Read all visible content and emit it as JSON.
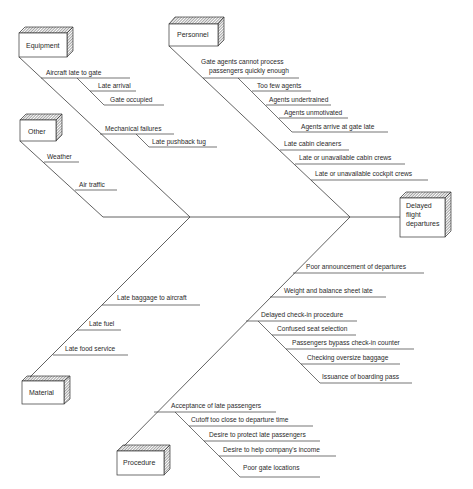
{
  "effect": {
    "lines": [
      "Delayed",
      "flight",
      "departures"
    ]
  },
  "categories": {
    "equipment": {
      "label": "Equipment",
      "causes": [
        {
          "label": "Aircraft late to gate",
          "subcauses": [
            "Late arrival",
            "Gate occupied"
          ]
        },
        {
          "label": "Mechanical failures",
          "subcauses": [
            "Late pushback tug"
          ]
        }
      ]
    },
    "other": {
      "label": "Other",
      "causes": [
        {
          "label": "Weather"
        },
        {
          "label": "Air traffic"
        }
      ]
    },
    "personnel": {
      "label": "Personnel",
      "causes": [
        {
          "label_lines": [
            "Gate agents cannot process",
            "passengers quickly enough"
          ],
          "subcauses": [
            "Too few agents",
            "Agents undertrained",
            "Agents unmotivated",
            "Agents arrive at gate late"
          ]
        },
        {
          "label": "Late cabin cleaners"
        },
        {
          "label": "Late or unavailable cabin crews"
        },
        {
          "label": "Late or unavailable cockpit crews"
        }
      ]
    },
    "material": {
      "label": "Material",
      "causes": [
        {
          "label": "Late baggage to aircraft"
        },
        {
          "label": "Late fuel"
        },
        {
          "label": "Late food service"
        }
      ]
    },
    "procedure": {
      "label": "Procedure",
      "causes": [
        {
          "label": "Poor announcement of departures"
        },
        {
          "label": "Weight and balance sheet late"
        },
        {
          "label": "Delayed check-in procedure",
          "subcauses": [
            "Confused seat selection",
            "Passengers bypass check-in counter",
            "Checking oversize baggage",
            "Issuance of boarding pass"
          ]
        },
        {
          "label": "Acceptance of late passengers",
          "subcauses": [
            "Cutoff too close to departure time",
            "Desire to protect late passengers",
            "Desire to help company's income",
            "Poor gate locations"
          ]
        }
      ]
    }
  }
}
